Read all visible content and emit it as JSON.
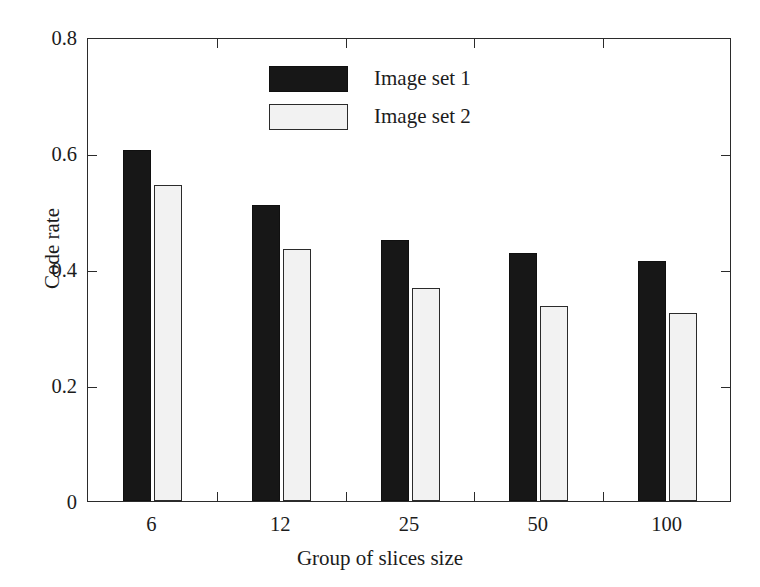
{
  "chart_data": {
    "type": "bar",
    "title": "",
    "xlabel": "Group of slices size",
    "ylabel": "Code rate",
    "categories": [
      "6",
      "12",
      "25",
      "50",
      "100"
    ],
    "series": [
      {
        "name": "Image set 1",
        "color": "#171717",
        "values": [
          0.605,
          0.51,
          0.45,
          0.427,
          0.414
        ]
      },
      {
        "name": "Image set 2",
        "color": "#f2f2f2",
        "values": [
          0.545,
          0.435,
          0.368,
          0.336,
          0.325
        ]
      }
    ],
    "ylim": [
      0,
      0.8
    ],
    "yticks": [
      "0",
      "0.2",
      "0.4",
      "0.6",
      "0.8"
    ],
    "ytick_values": [
      0,
      0.2,
      0.4,
      0.6,
      0.8
    ],
    "grid": false,
    "legend_position": "top-center",
    "legend": [
      "Image set 1",
      "Image set 2"
    ]
  },
  "axes": {
    "y_title": "Code rate",
    "x_title": "Group of slices size"
  }
}
